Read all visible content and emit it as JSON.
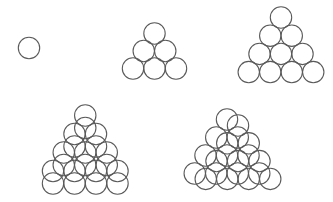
{
  "diagram": {
    "width": 333,
    "height": 202,
    "background": "#ffffff",
    "stroke_color": "#5a5a5a",
    "circle_radius": 10.7,
    "horizontal_spacing": 21.5,
    "figures": [
      {
        "id": "single-circle",
        "layers": [
          {
            "top": [
              29,
              48
            ],
            "rows": 1,
            "row_spacing": 18
          }
        ]
      },
      {
        "id": "triangle-3-rows",
        "layers": [
          {
            "top": [
              154.5,
              33.5
            ],
            "rows": 3,
            "row_spacing": 17.5
          }
        ]
      },
      {
        "id": "triangle-4-rows",
        "layers": [
          {
            "top": [
              281,
              17.5
            ],
            "rows": 4,
            "row_spacing": 18.2
          }
        ]
      },
      {
        "id": "two-layers-vertical-offset",
        "layers": [
          {
            "top": [
              85.25,
              115.5
            ],
            "rows": 4,
            "row_spacing": 18.5
          },
          {
            "top": [
              85.25,
              128
            ],
            "rows": 4,
            "row_spacing": 18.5
          }
        ]
      },
      {
        "id": "two-layers-diagonal-offset",
        "layers": [
          {
            "top": [
              227,
              119.5
            ],
            "rows": 4,
            "row_spacing": 18
          },
          {
            "top": [
              238,
              125.5
            ],
            "rows": 4,
            "row_spacing": 17.8
          }
        ]
      }
    ]
  }
}
